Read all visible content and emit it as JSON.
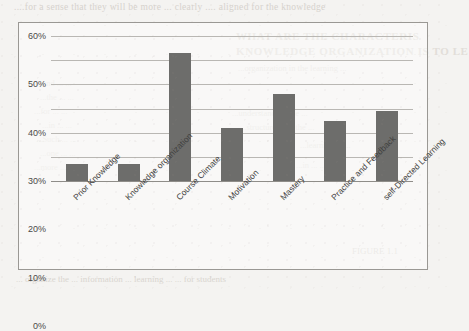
{
  "page": {
    "background_color": "#f4f3f1",
    "bleed_through": {
      "top_line": "....for a sense that they will be more ... clearly ....  aligned for the knowledge",
      "heading_1": "WHAT ARE THE CHARACTERIS",
      "heading_2": "KNOWLEDGE ORGANIZATION IS TO LE",
      "body_1": "...organization in the learning ...",
      "body_2": "...understanding the ...",
      "body_3": "...structure ... in the ...",
      "left_1": "...and ... ...",
      "left_2": "...the ... ...",
      "left_3": "...for ... ...",
      "left_4": "...in ... ...",
      "left_5": "...Such ... ...",
      "left_6": "...one ... ...",
      "left_7": "...more ... ...",
      "right_1": "...learning is ...",
      "right_2": "...in ... ...",
      "bottom_line": "...  organize the ... information ... learning ...  ... for students",
      "bottom_right": "FIGURE 1.1"
    }
  },
  "chart_data": {
    "type": "bar",
    "title": "",
    "subtitle": "",
    "xlabel": "",
    "ylabel": "",
    "categories": [
      "Prior Knowledge",
      "Knowledge organization",
      "Course Climate",
      "Motivation",
      "Mastery",
      "Practice and Feedback",
      "self-Directed Learning"
    ],
    "values": [
      7,
      7,
      53,
      22,
      36,
      25,
      29
    ],
    "value_labels": [
      "7%",
      "7%",
      "53%",
      "22%",
      "36%",
      "25%",
      "29%"
    ],
    "ylim": [
      0,
      60
    ],
    "ytick_labels": [
      "0%",
      "10%",
      "20%",
      "30%",
      "40%",
      "50%",
      "60%"
    ],
    "ytick_values": [
      0,
      10,
      20,
      30,
      40,
      50,
      60
    ],
    "grid": true,
    "legend": false,
    "legend_position": "none",
    "series": [
      {
        "name": "",
        "values": [
          7,
          7,
          53,
          22,
          36,
          25,
          29
        ]
      }
    ],
    "colors": {
      "bar": "#6d6d6b",
      "gridline": "#b9b7b3",
      "axis": "#8f8d89",
      "frame": "#9a9894",
      "text": "#3f3f3e",
      "plot_background": "#ffffff"
    }
  }
}
